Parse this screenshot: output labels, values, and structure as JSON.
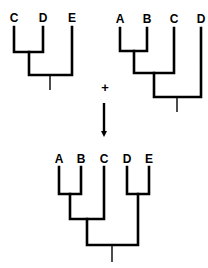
{
  "diagram": {
    "type": "phylogenetic-tree-merge",
    "colors": {
      "line": "#000000",
      "background": "#ffffff"
    },
    "tree_left": {
      "taxa": [
        "C",
        "D",
        "E"
      ],
      "topology": "((C,D),E)"
    },
    "tree_right": {
      "taxa": [
        "A",
        "B",
        "C",
        "D"
      ],
      "topology": "(((A,B),C),D)"
    },
    "operator": "+",
    "arrow": "down-arrow",
    "tree_result": {
      "taxa": [
        "A",
        "B",
        "C",
        "D",
        "E"
      ],
      "topology": "(((A,B),C),(D,E))"
    }
  }
}
